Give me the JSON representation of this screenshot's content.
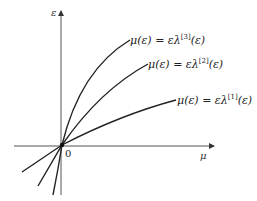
{
  "diagram": {
    "axes": {
      "x_label": "μ",
      "y_label": "ε",
      "origin_label": "0"
    },
    "curves": [
      {
        "name": "curve-1",
        "lhs": "μ(ε) = ελ",
        "sup": "[1]",
        "rhs": "(ε)"
      },
      {
        "name": "curve-2",
        "lhs": "μ(ε) = ελ",
        "sup": "[2]",
        "rhs": "(ε)"
      },
      {
        "name": "curve-3",
        "lhs": "μ(ε) = ελ",
        "sup": "[3]",
        "rhs": "(ε)"
      }
    ]
  }
}
